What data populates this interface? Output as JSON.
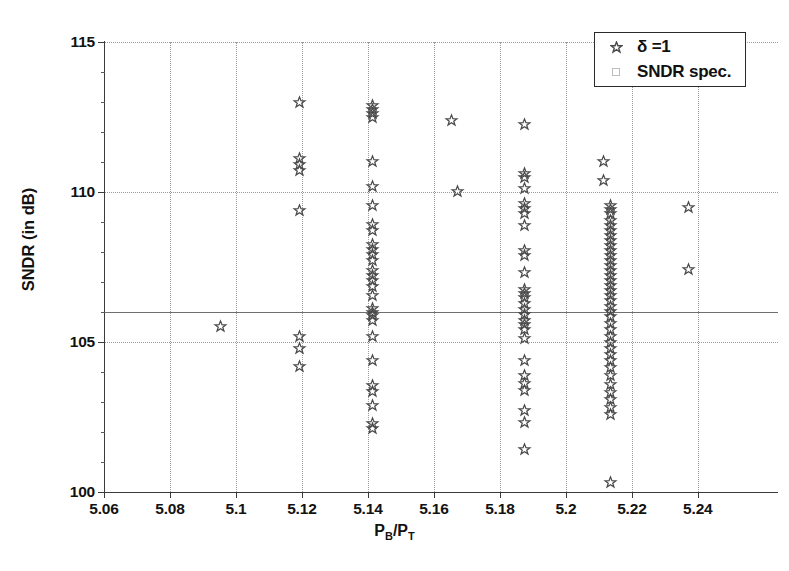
{
  "chart_data": {
    "type": "scatter",
    "title": "",
    "xlabel": "P_B/P_T",
    "xlabel_parts": {
      "p1": "P",
      "sub1": "B",
      "slash": "/P",
      "sub2": "T"
    },
    "ylabel": "SNDR (in dB)",
    "xlim": [
      5.06,
      5.2643
    ],
    "ylim": [
      100,
      115
    ],
    "xticks": [
      5.06,
      5.08,
      5.1,
      5.12,
      5.14,
      5.16,
      5.18,
      5.2,
      5.22,
      5.24
    ],
    "xticklabels": [
      "5.06",
      "5.08",
      "5.1",
      "5.12",
      "5.14",
      "5.16",
      "5.18",
      "5.2",
      "5.22",
      "5.24"
    ],
    "yticks": [
      100,
      105,
      110,
      115
    ],
    "yticklabels": [
      "100",
      "105",
      "110",
      "115"
    ],
    "grid": true,
    "grid_style": "dotted",
    "legend_position": "top-right",
    "legend": [
      {
        "label": "δ =1",
        "marker": "star",
        "color": "#4a4a4a"
      },
      {
        "label": "SNDR spec.",
        "marker": "square",
        "color": "#bdbdbd"
      }
    ],
    "annotations": [
      {
        "type": "hline",
        "name": "sndr-spec-line",
        "y": 106.0,
        "style": "solid",
        "color": "#6f6f6f"
      }
    ],
    "series": [
      {
        "name": "δ =1",
        "marker": "star",
        "color": "#4a4a4a",
        "points": [
          [
            5.0952,
            105.52
          ],
          [
            5.1192,
            112.98
          ],
          [
            5.1192,
            111.12
          ],
          [
            5.1192,
            110.92
          ],
          [
            5.1192,
            110.72
          ],
          [
            5.1192,
            109.38
          ],
          [
            5.1192,
            105.18
          ],
          [
            5.1192,
            104.78
          ],
          [
            5.1192,
            104.18
          ],
          [
            5.1413,
            112.88
          ],
          [
            5.1413,
            112.75
          ],
          [
            5.1413,
            112.62
          ],
          [
            5.1413,
            112.5
          ],
          [
            5.1413,
            111.02
          ],
          [
            5.1413,
            110.2
          ],
          [
            5.1413,
            109.55
          ],
          [
            5.1413,
            108.92
          ],
          [
            5.1413,
            108.72
          ],
          [
            5.1413,
            108.25
          ],
          [
            5.1413,
            108.08
          ],
          [
            5.1413,
            107.92
          ],
          [
            5.1413,
            107.72
          ],
          [
            5.1413,
            107.4
          ],
          [
            5.1413,
            107.22
          ],
          [
            5.1413,
            107.05
          ],
          [
            5.1413,
            106.85
          ],
          [
            5.1413,
            106.55
          ],
          [
            5.1413,
            106.12
          ],
          [
            5.1413,
            106.0
          ],
          [
            5.1413,
            105.88
          ],
          [
            5.1413,
            105.72
          ],
          [
            5.1413,
            105.18
          ],
          [
            5.1413,
            104.38
          ],
          [
            5.1413,
            103.55
          ],
          [
            5.1413,
            103.35
          ],
          [
            5.1413,
            102.88
          ],
          [
            5.1413,
            102.3
          ],
          [
            5.1413,
            102.12
          ],
          [
            5.1652,
            112.4
          ],
          [
            5.1672,
            110.02
          ],
          [
            5.1876,
            112.25
          ],
          [
            5.1876,
            110.62
          ],
          [
            5.1876,
            110.48
          ],
          [
            5.1876,
            110.12
          ],
          [
            5.1876,
            109.62
          ],
          [
            5.1876,
            109.45
          ],
          [
            5.1876,
            109.28
          ],
          [
            5.1876,
            108.88
          ],
          [
            5.1876,
            108.05
          ],
          [
            5.1876,
            107.88
          ],
          [
            5.1876,
            107.32
          ],
          [
            5.1876,
            106.75
          ],
          [
            5.1876,
            106.62
          ],
          [
            5.1876,
            106.48
          ],
          [
            5.1876,
            106.28
          ],
          [
            5.1876,
            106.08
          ],
          [
            5.1876,
            105.92
          ],
          [
            5.1876,
            105.72
          ],
          [
            5.1876,
            105.58
          ],
          [
            5.1876,
            105.42
          ],
          [
            5.1876,
            105.12
          ],
          [
            5.1876,
            104.38
          ],
          [
            5.1876,
            103.88
          ],
          [
            5.1876,
            103.62
          ],
          [
            5.1876,
            103.38
          ],
          [
            5.1876,
            102.72
          ],
          [
            5.1876,
            102.32
          ],
          [
            5.1876,
            101.42
          ],
          [
            5.2114,
            111.02
          ],
          [
            5.2114,
            110.38
          ],
          [
            5.2136,
            109.55
          ],
          [
            5.2136,
            109.42
          ],
          [
            5.2136,
            109.28
          ],
          [
            5.2136,
            109.05
          ],
          [
            5.2136,
            108.88
          ],
          [
            5.2136,
            108.72
          ],
          [
            5.2136,
            108.55
          ],
          [
            5.2136,
            108.4
          ],
          [
            5.2136,
            108.22
          ],
          [
            5.2136,
            108.05
          ],
          [
            5.2136,
            107.88
          ],
          [
            5.2136,
            107.72
          ],
          [
            5.2136,
            107.55
          ],
          [
            5.2136,
            107.38
          ],
          [
            5.2136,
            107.22
          ],
          [
            5.2136,
            107.05
          ],
          [
            5.2136,
            106.88
          ],
          [
            5.2136,
            106.72
          ],
          [
            5.2136,
            106.55
          ],
          [
            5.2136,
            106.38
          ],
          [
            5.2136,
            106.18
          ],
          [
            5.2136,
            106.02
          ],
          [
            5.2136,
            105.85
          ],
          [
            5.2136,
            105.62
          ],
          [
            5.2136,
            105.42
          ],
          [
            5.2136,
            105.18
          ],
          [
            5.2136,
            105.0
          ],
          [
            5.2136,
            104.78
          ],
          [
            5.2136,
            104.58
          ],
          [
            5.2136,
            104.38
          ],
          [
            5.2136,
            104.15
          ],
          [
            5.2136,
            103.88
          ],
          [
            5.2136,
            103.58
          ],
          [
            5.2136,
            103.32
          ],
          [
            5.2136,
            103.08
          ],
          [
            5.2136,
            102.82
          ],
          [
            5.2136,
            102.58
          ],
          [
            5.2136,
            100.32
          ],
          [
            5.2372,
            109.48
          ],
          [
            5.2372,
            107.42
          ]
        ]
      }
    ]
  }
}
